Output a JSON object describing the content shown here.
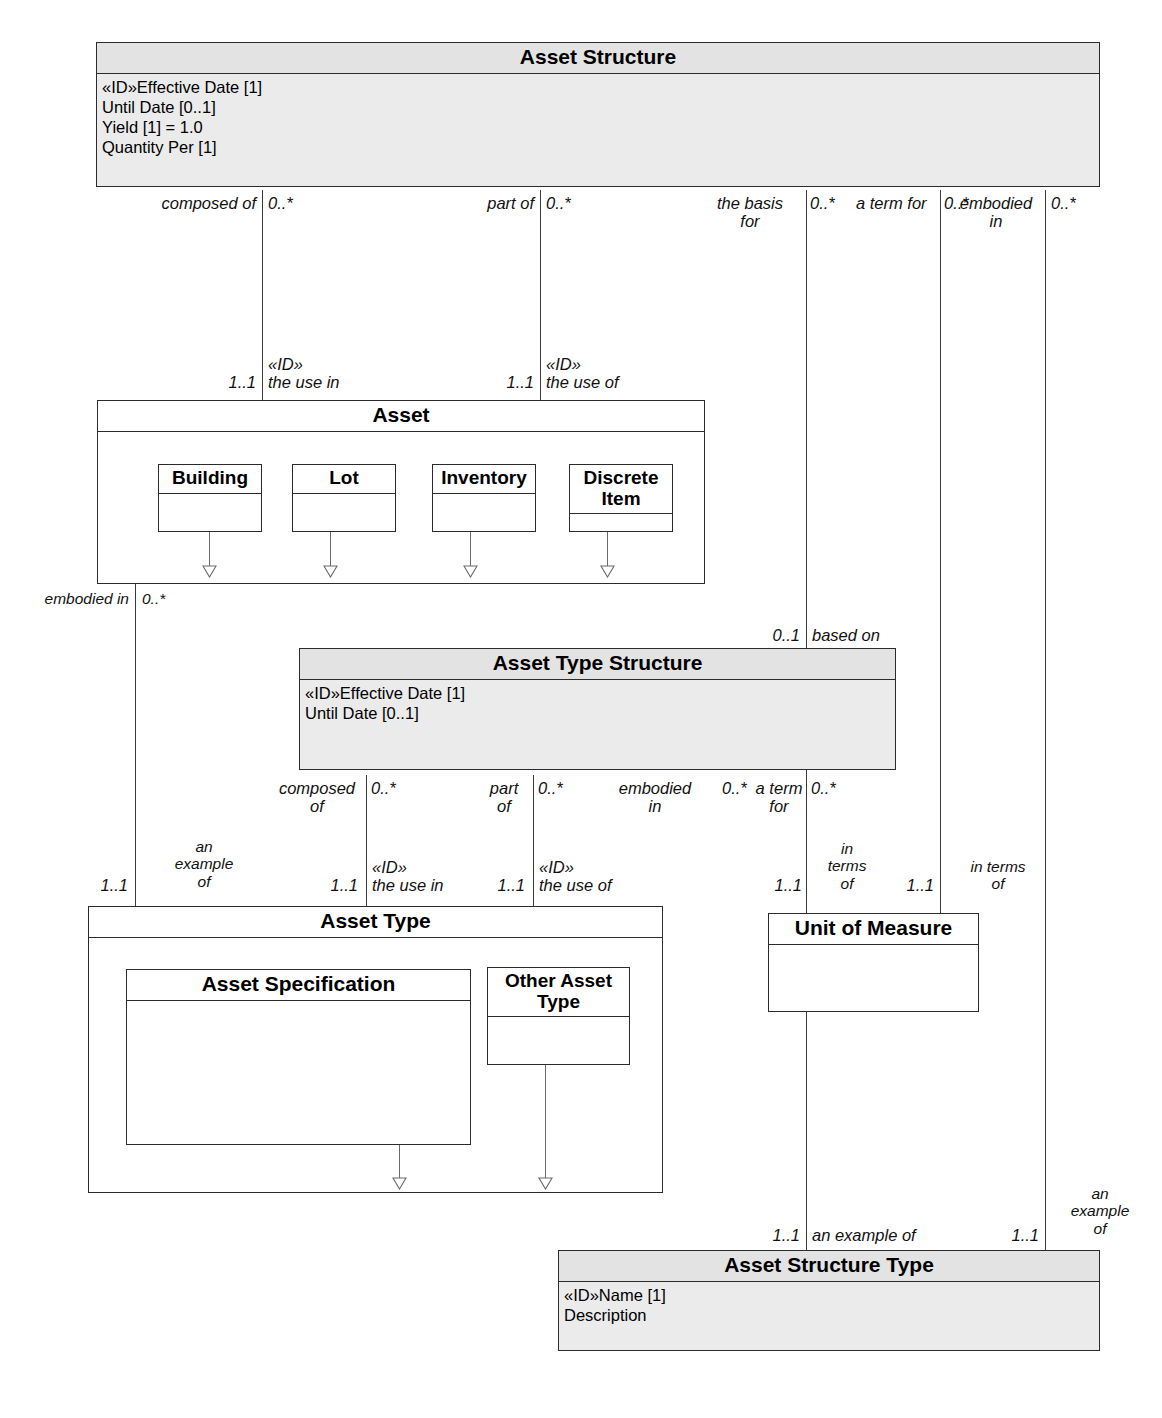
{
  "diagram": {
    "kind": "uml-class-diagram",
    "classes": {
      "asset_structure": {
        "title": "Asset Structure",
        "attributes": "«ID»Effective Date [1]\nUntil Date [0..1]\nYield [1] = 1.0\nQuantity Per [1]"
      },
      "asset": {
        "title": "Asset",
        "attributes": ""
      },
      "building": {
        "title": "Building",
        "attributes": ""
      },
      "lot": {
        "title": "Lot",
        "attributes": ""
      },
      "inventory": {
        "title": "Inventory",
        "attributes": ""
      },
      "discrete_item": {
        "title": "Discrete\nItem",
        "attributes": ""
      },
      "asset_type_structure": {
        "title": "Asset Type Structure",
        "attributes": "«ID»Effective Date [1]\nUntil Date [0..1]"
      },
      "asset_type": {
        "title": "Asset Type",
        "attributes": ""
      },
      "asset_specification": {
        "title": "Asset Specification",
        "attributes": ""
      },
      "other_asset_type": {
        "title": "Other Asset\nType",
        "attributes": ""
      },
      "unit_of_measure": {
        "title": "Unit of Measure",
        "attributes": ""
      },
      "asset_structure_type": {
        "title": "Asset Structure Type",
        "attributes": "«ID»Name [1]\nDescription"
      }
    },
    "labels": {
      "composed_of_top": "composed of",
      "mult_0star_a": "0..*",
      "part_of_top": "part of",
      "mult_0star_b": "0..*",
      "the_basis_for": "the basis\nfor",
      "mult_0star_c": "0..*",
      "a_term_for_top": "a term for",
      "embodied_in_top": "embodied\nin",
      "mult_0star_d": "0..*",
      "mult_0star_e": "0..*",
      "mult_11_a": "1..1",
      "id_the_use_in_top": "«ID»\nthe use in",
      "mult_11_b": "1..1",
      "id_the_use_of_top": "«ID»\nthe use of",
      "embodied_in_left": "embodied in",
      "mult_0star_left": "0..*",
      "mult_01_based": "0..1",
      "based_on": "based on",
      "composed_of_mid": "composed\nof",
      "mult_0star_f": "0..*",
      "part_of_mid": "part\nof",
      "mult_0star_g": "0..*",
      "embodied_in_mid": "embodied\nin",
      "mult_0star_h": "0..*",
      "a_term_for_mid": "a term\nfor",
      "mult_0star_i": "0..*",
      "an_example_of_left": "an\nexample\nof",
      "mult_11_left": "1..1",
      "mult_11_c": "1..1",
      "id_the_use_in_mid": "«ID»\nthe use in",
      "mult_11_d": "1..1",
      "id_the_use_of_mid": "«ID»\nthe use of",
      "in_terms_of_1": "in\nterms\nof",
      "mult_11_uom_l": "1..1",
      "mult_11_uom_r": "1..1",
      "in_terms_of_2": "in terms\nof",
      "mult_11_bottom_l": "1..1",
      "an_example_of_bottom": "an example of",
      "mult_11_bottom_r": "1..1",
      "an_example_of_right": "an\nexample\nof"
    },
    "colors": {
      "line": "#3a3a3a",
      "box_border": "#2b2b2b",
      "shaded_fill": "#ebebeb",
      "background": "#ffffff"
    }
  }
}
